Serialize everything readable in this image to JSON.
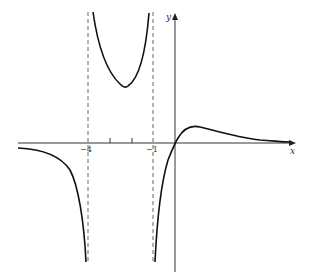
{
  "figure": {
    "type": "function-graph",
    "axes": {
      "x_label": "x",
      "y_label": "y"
    },
    "tick_labels": {
      "x_neg4": "−4",
      "x_neg1": "−1"
    },
    "asymptotes": {
      "vertical": [
        -4,
        -1
      ],
      "horizontal": 0
    },
    "colors": {
      "curve": "#111111",
      "axis": "#333333",
      "dashed": "#555555"
    }
  }
}
